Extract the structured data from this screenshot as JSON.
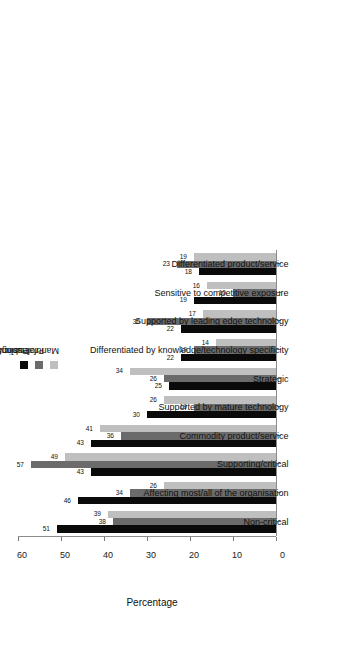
{
  "chart_data": {
    "type": "bar",
    "title": "",
    "subtitle": "",
    "orientation": "vertical-rotated",
    "xlabel": "",
    "ylabel": "Percentage",
    "ylim": [
      0,
      60
    ],
    "yticks": [
      0,
      10,
      20,
      30,
      40,
      50,
      60
    ],
    "grid": false,
    "legend_position": "right",
    "categories": [
      "Non-critical",
      "Affecting most/all of the organisation",
      "Supporting/critical",
      "Commodity product/service",
      "Supported by mature technology",
      "Strategic",
      "Differentiated by knowledge/technology specificity",
      "Supported by leading edge technology",
      "Sensitive to competitive exposure",
      "Differentiated product/service"
    ],
    "series": [
      {
        "name": "Public Services",
        "color": "#0a0a0a",
        "values": [
          51,
          46,
          43,
          43,
          30,
          25,
          22,
          22,
          19,
          18
        ]
      },
      {
        "name": "Professional Services",
        "color": "#6b6b6b",
        "values": [
          38,
          34,
          57,
          36,
          19,
          26,
          19,
          30,
          10,
          23
        ]
      },
      {
        "name": "Manufacturing/Engineering/Construction",
        "color": "#bfbfbf",
        "values": [
          39,
          26,
          49,
          41,
          26,
          34,
          14,
          17,
          16,
          19
        ]
      }
    ]
  },
  "axis": {
    "value_axis_title": "Percentage",
    "tick_labels": [
      "0",
      "10",
      "20",
      "30",
      "40",
      "50",
      "60"
    ]
  },
  "legend": {
    "entries": [
      {
        "label": "Public Services",
        "color": "#0a0a0a"
      },
      {
        "label": "Professional Services",
        "color": "#6b6b6b"
      },
      {
        "label": "Manufacturing/Engineering/Construction",
        "color": "#bfbfbf"
      }
    ]
  }
}
